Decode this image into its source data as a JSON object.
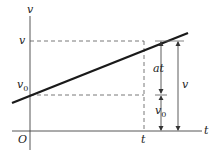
{
  "diagram": {
    "axes": {
      "y_label": "v",
      "x_label": "t",
      "origin_label": "O"
    },
    "tick_labels": {
      "v": "v",
      "v0": "v",
      "v0_sub": "0",
      "t": "t"
    },
    "annotations": {
      "at": "at",
      "v0": "v",
      "v0_sub": "0",
      "v": "v"
    },
    "colors": {
      "line": "#1a1a1a",
      "axis": "#333333",
      "dashed": "#444444"
    }
  }
}
